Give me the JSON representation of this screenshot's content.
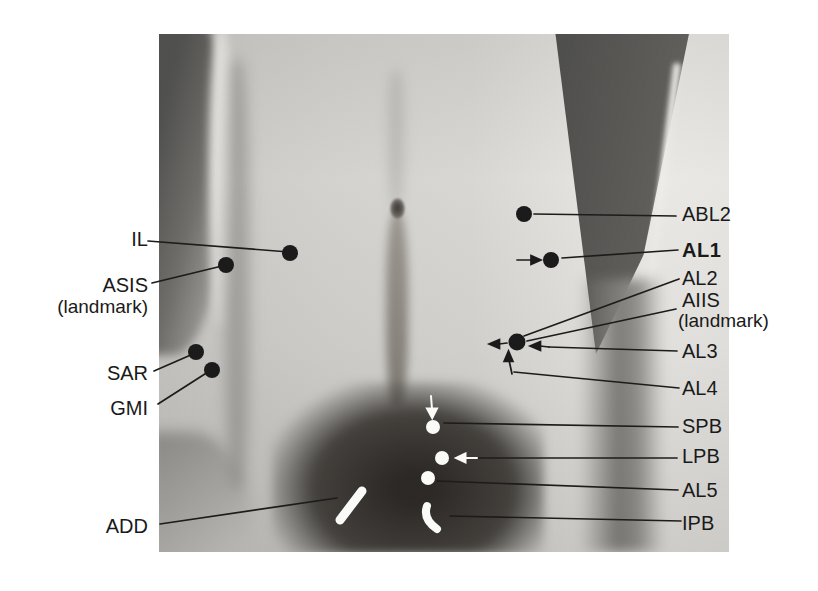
{
  "figure": {
    "type": "annotated-anatomical-photograph",
    "labels": {
      "il": "IL",
      "asis": "ASIS",
      "asis_suffix": "(landmark)",
      "sar": "SAR",
      "gmi": "GMI",
      "add": "ADD",
      "abl2": "ABL2",
      "al1": "AL1",
      "al2": "AL2",
      "aiis": "AIIS",
      "aiis_suffix": "(landmark)",
      "al3": "AL3",
      "al4": "AL4",
      "spb": "SPB",
      "lpb": "LPB",
      "al5": "AL5",
      "ipb": "IPB"
    },
    "colors": {
      "page_bg": "#ffffff",
      "marker_black": "#1b1b1b",
      "marker_white": "#fafaf8",
      "leader_line": "#1c1c1c",
      "label_text": "#1a1a1a"
    }
  }
}
